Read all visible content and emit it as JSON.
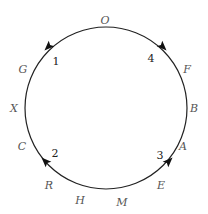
{
  "diagram": {
    "type": "circular-cycle",
    "circle": {
      "cx": 106,
      "cy": 108,
      "r": 81,
      "stroke": "#222222"
    },
    "letters": [
      {
        "text": "O",
        "x": 105,
        "y": 24
      },
      {
        "text": "G",
        "x": 23,
        "y": 73
      },
      {
        "text": "F",
        "x": 187,
        "y": 73
      },
      {
        "text": "X",
        "x": 14,
        "y": 112
      },
      {
        "text": "B",
        "x": 194,
        "y": 112
      },
      {
        "text": "C",
        "x": 22,
        "y": 150
      },
      {
        "text": "A",
        "x": 183,
        "y": 150
      },
      {
        "text": "R",
        "x": 49,
        "y": 189
      },
      {
        "text": "E",
        "x": 161,
        "y": 189
      },
      {
        "text": "H",
        "x": 80,
        "y": 204
      },
      {
        "text": "M",
        "x": 122,
        "y": 206
      }
    ],
    "numbers": [
      {
        "text": "1",
        "x": 56,
        "y": 65
      },
      {
        "text": "4",
        "x": 151,
        "y": 62
      },
      {
        "text": "2",
        "x": 55,
        "y": 157
      },
      {
        "text": "3",
        "x": 160,
        "y": 159
      }
    ],
    "arrows": [
      {
        "name": "arrow-1",
        "x": 48,
        "y": 47,
        "angle": 135
      },
      {
        "name": "arrow-4",
        "x": 163,
        "y": 47,
        "angle": 45
      },
      {
        "name": "arrow-2",
        "x": 45,
        "y": 161,
        "angle": 225
      },
      {
        "name": "arrow-3",
        "x": 169,
        "y": 161,
        "angle": -45
      }
    ]
  }
}
